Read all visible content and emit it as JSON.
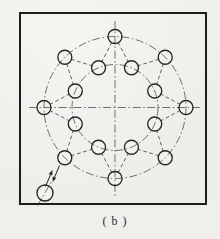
{
  "app": {
    "type": "engineering-figure",
    "caption": "( b )"
  },
  "colors": {
    "paper": "#f1f0ec",
    "hole_fill": "#f3f2ee",
    "outline": "#1d1d1d",
    "hole_stroke": "#262626",
    "centerline": "#4e4e4e",
    "construction": "#515151",
    "arrow": "#1f1f1f"
  },
  "drawing": {
    "width": 220,
    "height": 239,
    "border": {
      "x": 20,
      "y": 13,
      "w": 186,
      "h": 191,
      "stroke_w": 2
    },
    "center": {
      "x": 115,
      "y": 107.5
    },
    "outer_ring": {
      "radius": 71,
      "hole_angles_deg": [
        0,
        45,
        90,
        135,
        180,
        225,
        270,
        315
      ]
    },
    "inner_ring": {
      "radius": 43,
      "hole_angles_deg": [
        22.5,
        67.5,
        112.5,
        157.5,
        202.5,
        247.5,
        292.5,
        337.5
      ]
    },
    "hole_radius": 7,
    "zigzag_offset_deg": 22.5,
    "centerline_h": {
      "x1": 29,
      "y": 107.5,
      "x2": 200
    },
    "centerline_v": {
      "x": 115,
      "y1": 21,
      "y2": 196
    },
    "source_hole": {
      "x": 45,
      "y": 193,
      "r": 8
    },
    "source_centerline": {
      "x1": 37.5,
      "y1": 205.5,
      "x2": 52,
      "y2": 181
    },
    "arrows": [
      {
        "x1": 45.5,
        "y1": 186.5,
        "x2": 52.5,
        "y2": 170
      },
      {
        "x1": 59.5,
        "y1": 165.5,
        "x2": 52.5,
        "y2": 182
      }
    ],
    "dash_centerline": "8 2.6 1.6 2.6",
    "dash_construction": "3.8 2.6",
    "stroke_w_centerline": 0.8,
    "stroke_w_construction": 0.9,
    "stroke_w_hole": 1.35
  }
}
